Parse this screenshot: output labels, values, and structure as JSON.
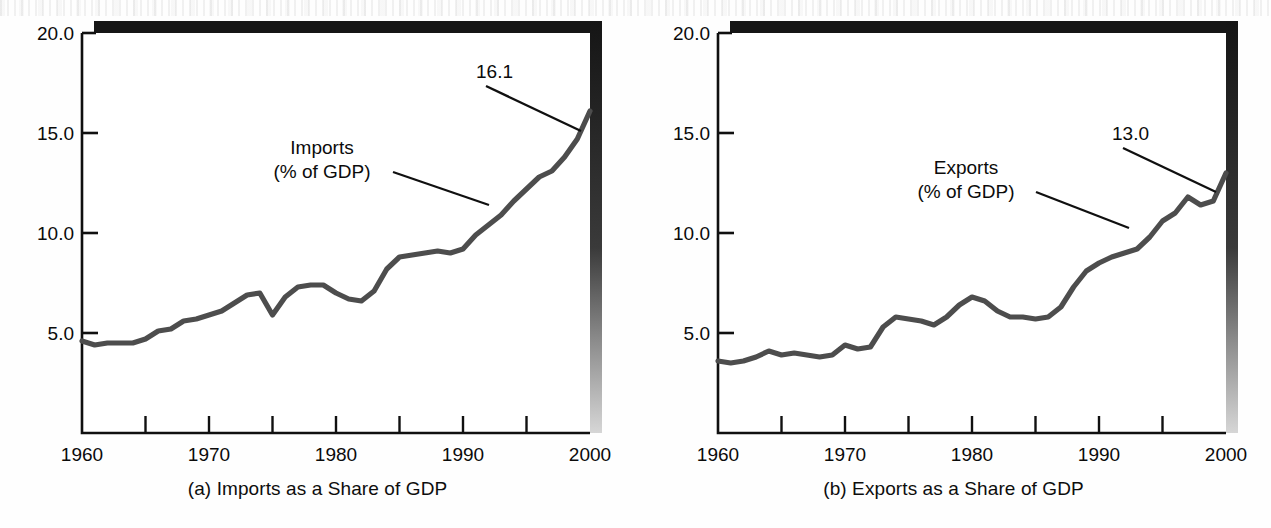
{
  "figure": {
    "background_color": "#ffffff",
    "line_color": "#4a4a4a",
    "frame_color": "#111111",
    "shadow_color": "#1a1a1a"
  },
  "panels": [
    {
      "id": "imports",
      "caption": "(a) Imports as a Share of GDP",
      "series_label_line1": "Imports",
      "series_label_line2": "(% of GDP)",
      "end_value_label": "16.1"
    },
    {
      "id": "exports",
      "caption": "(b) Exports as a Share of GDP",
      "series_label_line1": "Exports",
      "series_label_line2": "(% of GDP)",
      "end_value_label": "13.0"
    }
  ],
  "chart_data": [
    {
      "type": "line",
      "title": "(a) Imports as a Share of GDP",
      "xlabel": "",
      "ylabel": "",
      "legend_position": "inside-center",
      "grid": false,
      "xlim": [
        1960,
        2000
      ],
      "ylim": [
        0.0,
        20.0
      ],
      "ytick_labels": [
        "5.0",
        "10.0",
        "15.0",
        "20.0"
      ],
      "ytick_values": [
        5.0,
        10.0,
        15.0,
        20.0
      ],
      "xtick_labels": [
        "1960",
        "1970",
        "1980",
        "1990",
        "2000"
      ],
      "xtick_values": [
        1960,
        1970,
        1980,
        1990,
        2000
      ],
      "xminor_ticks": [
        1965,
        1975,
        1985,
        1995
      ],
      "annotations": [
        {
          "text": "16.1",
          "x": 2000,
          "y": 16.1
        },
        {
          "text": "Imports\n(% of GDP)",
          "x": 1986,
          "y": 13.2
        }
      ],
      "series": [
        {
          "name": "Imports (% of GDP)",
          "x": [
            1960,
            1961,
            1962,
            1963,
            1964,
            1965,
            1966,
            1967,
            1968,
            1969,
            1970,
            1971,
            1972,
            1973,
            1974,
            1975,
            1976,
            1977,
            1978,
            1979,
            1980,
            1981,
            1982,
            1983,
            1984,
            1985,
            1986,
            1987,
            1988,
            1989,
            1990,
            1991,
            1992,
            1993,
            1994,
            1995,
            1996,
            1997,
            1998,
            1999,
            2000
          ],
          "values": [
            4.6,
            4.4,
            4.5,
            4.5,
            4.5,
            4.7,
            5.1,
            5.2,
            5.6,
            5.7,
            5.9,
            6.1,
            6.5,
            6.9,
            7.0,
            5.9,
            6.8,
            7.3,
            7.4,
            7.4,
            7.0,
            6.7,
            6.6,
            7.1,
            8.2,
            8.8,
            8.9,
            9.0,
            9.1,
            9.0,
            9.2,
            9.9,
            10.4,
            10.9,
            11.6,
            12.2,
            12.8,
            13.1,
            13.8,
            14.7,
            16.1
          ]
        }
      ]
    },
    {
      "type": "line",
      "title": "(b) Exports as a Share of GDP",
      "xlabel": "",
      "ylabel": "",
      "legend_position": "inside-center",
      "grid": false,
      "xlim": [
        1960,
        2000
      ],
      "ylim": [
        0.0,
        20.0
      ],
      "ytick_labels": [
        "5.0",
        "10.0",
        "15.0",
        "20.0"
      ],
      "ytick_values": [
        5.0,
        10.0,
        15.0,
        20.0
      ],
      "xtick_labels": [
        "1960",
        "1970",
        "1980",
        "1990",
        "2000"
      ],
      "xtick_values": [
        1960,
        1970,
        1980,
        1990,
        2000
      ],
      "xminor_ticks": [
        1965,
        1975,
        1985,
        1995
      ],
      "annotations": [
        {
          "text": "13.0",
          "x": 2000,
          "y": 13.0
        },
        {
          "text": "Exports\n(% of GDP)",
          "x": 1986,
          "y": 13.0
        }
      ],
      "series": [
        {
          "name": "Exports (% of GDP)",
          "x": [
            1960,
            1961,
            1962,
            1963,
            1964,
            1965,
            1966,
            1967,
            1968,
            1969,
            1970,
            1971,
            1972,
            1973,
            1974,
            1975,
            1976,
            1977,
            1978,
            1979,
            1980,
            1981,
            1982,
            1983,
            1984,
            1985,
            1986,
            1987,
            1988,
            1989,
            1990,
            1991,
            1992,
            1993,
            1994,
            1995,
            1996,
            1997,
            1998,
            1999,
            2000
          ],
          "values": [
            3.6,
            3.5,
            3.6,
            3.8,
            4.1,
            3.9,
            4.0,
            3.9,
            3.8,
            3.9,
            4.4,
            4.2,
            4.3,
            5.3,
            5.8,
            5.7,
            5.6,
            5.4,
            5.8,
            6.4,
            6.8,
            6.6,
            6.1,
            5.8,
            5.8,
            5.7,
            5.8,
            6.3,
            7.3,
            8.1,
            8.5,
            8.8,
            9.0,
            9.2,
            9.8,
            10.6,
            11.0,
            11.8,
            11.4,
            11.6,
            13.0
          ]
        }
      ]
    }
  ]
}
